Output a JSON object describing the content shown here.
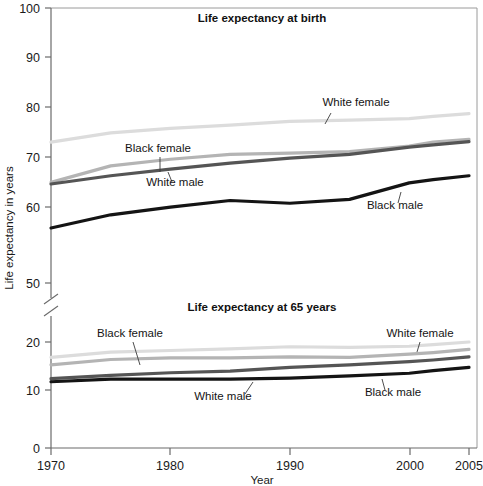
{
  "figure": {
    "width": 483,
    "height": 486,
    "background": "#ffffff"
  },
  "axis": {
    "y_title": "Life expectancy in years",
    "x_title": "Year",
    "y_ticks_upper": [
      "100",
      "90",
      "80",
      "70",
      "60",
      "50"
    ],
    "y_ticks_lower": [
      "20",
      "10",
      "0"
    ],
    "x_ticks": [
      "1970",
      "1980",
      "1990",
      "2000",
      "2005"
    ],
    "has_break": true,
    "break_symbol": "axis-break-slashes"
  },
  "panels": [
    {
      "id": "birth",
      "title": "Life expectancy at birth"
    },
    {
      "id": "age65",
      "title": "Life expectancy at 65 years"
    }
  ],
  "colors": {
    "white_female": "#dcdcdc",
    "black_female": "#b4b4b4",
    "white_male": "#555555",
    "black_male": "#141414",
    "axis": "#6b6b6b",
    "frame": "#9a9a9a",
    "text": "#151515"
  },
  "annotations": [
    {
      "panel": "birth",
      "text": "White female",
      "x": 356,
      "y": 106,
      "leader_x1": 331,
      "leader_y1": 113,
      "leader_x2": 325,
      "leader_y2": 124
    },
    {
      "panel": "birth",
      "text": "Black female",
      "x": 158,
      "y": 152,
      "leader_x1": 160,
      "leader_y1": 157,
      "leader_x2": 160,
      "leader_y2": 172
    },
    {
      "panel": "birth",
      "text": "White male",
      "x": 175,
      "y": 186,
      "leader_x1": 172,
      "leader_y1": 182,
      "leader_x2": 168,
      "leader_y2": 172
    },
    {
      "panel": "birth",
      "text": "Black male",
      "x": 395,
      "y": 209,
      "leader_x1": 398,
      "leader_y1": 203,
      "leader_x2": 401,
      "leader_y2": 192
    },
    {
      "panel": "age65",
      "text": "Black female",
      "x": 130,
      "y": 337,
      "leader_x1": 133,
      "leader_y1": 342,
      "leader_x2": 140,
      "leader_y2": 365
    },
    {
      "panel": "age65",
      "text": "White male",
      "x": 223,
      "y": 400,
      "leader_x1": 245,
      "leader_y1": 394,
      "leader_x2": 253,
      "leader_y2": 382
    },
    {
      "panel": "age65",
      "text": "White female",
      "x": 420,
      "y": 337,
      "leader_x1": 420,
      "leader_y1": 342,
      "leader_x2": 417,
      "leader_y2": 352
    },
    {
      "panel": "age65",
      "text": "Black male",
      "x": 393,
      "y": 396,
      "leader_x1": 385,
      "leader_y1": 390,
      "leader_x2": 382,
      "leader_y2": 379
    }
  ],
  "chart_data": {
    "type": "line",
    "xlabel": "Year",
    "ylabel": "Life expectancy in years",
    "xlim": [
      1970,
      2005
    ],
    "grid": false,
    "legend": "inline-annotations",
    "axis_break": {
      "between": [
        50,
        20
      ],
      "note": "y-axis broken between 50 and 20"
    },
    "panels": [
      {
        "id": "birth",
        "title": "Life expectancy at birth",
        "ylim": [
          50,
          100
        ],
        "yticks": [
          50,
          60,
          70,
          80,
          90,
          100
        ],
        "x": [
          1970,
          1975,
          1980,
          1985,
          1990,
          1995,
          2000,
          2002,
          2005
        ],
        "series": [
          {
            "name": "White female",
            "color": "#dcdcdc",
            "values": [
              75.6,
              77.3,
              78.1,
              78.7,
              79.4,
              79.6,
              79.9,
              80.3,
              80.8
            ]
          },
          {
            "name": "Black female",
            "color": "#b4b4b4",
            "values": [
              68.3,
              71.3,
              72.5,
              73.4,
              73.6,
              73.9,
              74.9,
              75.6,
              76.1
            ]
          },
          {
            "name": "White male",
            "color": "#555555",
            "values": [
              68.0,
              69.5,
              70.7,
              71.8,
              72.7,
              73.4,
              74.7,
              75.1,
              75.7
            ]
          },
          {
            "name": "Black male",
            "color": "#141414",
            "values": [
              60.0,
              62.4,
              63.8,
              65.0,
              64.5,
              65.2,
              68.2,
              68.8,
              69.5
            ]
          }
        ]
      },
      {
        "id": "age65",
        "title": "Life expectancy at 65 years",
        "ylim": [
          0,
          20
        ],
        "yticks": [
          0,
          10,
          20
        ],
        "x": [
          1970,
          1975,
          1980,
          1985,
          1990,
          1995,
          2000,
          2002,
          2005
        ],
        "series": [
          {
            "name": "White female",
            "color": "#dcdcdc",
            "values": [
              17.1,
              18.1,
              18.4,
              18.7,
              19.1,
              19.0,
              19.2,
              19.5,
              20.0
            ]
          },
          {
            "name": "Black female",
            "color": "#b4b4b4",
            "values": [
              15.7,
              16.7,
              17.0,
              17.0,
              17.2,
              17.1,
              17.7,
              18.0,
              18.6
            ]
          },
          {
            "name": "White male",
            "color": "#555555",
            "values": [
              13.1,
              13.7,
              14.2,
              14.5,
              15.2,
              15.7,
              16.3,
              16.6,
              17.2
            ]
          },
          {
            "name": "Black male",
            "color": "#141414",
            "values": [
              12.5,
              13.0,
              13.0,
              13.0,
              13.2,
              13.6,
              14.1,
              14.6,
              15.2
            ]
          }
        ]
      }
    ]
  }
}
